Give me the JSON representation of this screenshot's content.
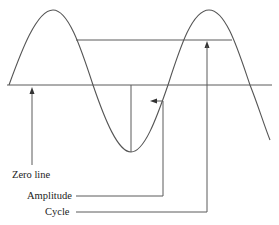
{
  "diagram": {
    "labels": {
      "zero_line": "Zero line",
      "amplitude": "Amplitude",
      "cycle": "Cycle"
    },
    "colors": {
      "stroke": "#555555",
      "text": "#222222",
      "background": "#ffffff"
    }
  }
}
